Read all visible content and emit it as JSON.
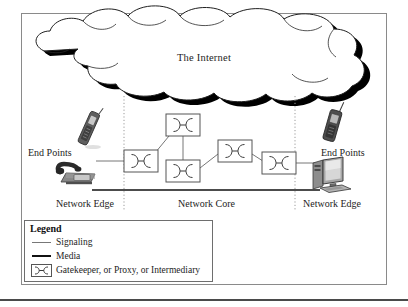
{
  "figure": {
    "cloud_label": "The Internet",
    "endpoint_label_left": "End Points",
    "endpoint_label_right": "End Points",
    "zone_labels": {
      "left": "Network Edge",
      "center": "Network Core",
      "right": "Network Edge"
    }
  },
  "legend": {
    "title": "Legend",
    "items": [
      {
        "symbol": "thin-line",
        "label": "Signaling"
      },
      {
        "symbol": "thick-line",
        "label": "Media"
      },
      {
        "symbol": "gatekeeper-box",
        "label": "Gatekeeper, or Proxy, or Intermediary"
      }
    ]
  },
  "nodes": {
    "gatekeepers": [
      {
        "id": "gk-edge-left",
        "x": 124,
        "y": 150,
        "w": 34,
        "h": 22
      },
      {
        "id": "gk-core-top",
        "x": 166,
        "y": 114,
        "w": 34,
        "h": 22
      },
      {
        "id": "gk-core-bottom",
        "x": 166,
        "y": 160,
        "w": 34,
        "h": 22
      },
      {
        "id": "gk-core-right",
        "x": 218,
        "y": 140,
        "w": 34,
        "h": 22
      },
      {
        "id": "gk-edge-right",
        "x": 262,
        "y": 152,
        "w": 34,
        "h": 22
      }
    ],
    "devices": [
      {
        "id": "mobile-phone-left",
        "type": "mobile-phone",
        "x": 80,
        "y": 115
      },
      {
        "id": "desk-phone-left",
        "type": "desk-phone",
        "x": 63,
        "y": 168
      },
      {
        "id": "mobile-phone-right",
        "type": "mobile-phone",
        "x": 324,
        "y": 110
      },
      {
        "id": "computer-right",
        "type": "desktop-computer",
        "x": 316,
        "y": 165
      }
    ]
  },
  "colors": {
    "signaling_line": "#777777",
    "media_line": "#111111",
    "frame_border": "#8a8a8a",
    "cloud_outline": "#222222",
    "cloud_shadow": "#000000",
    "divider_dotted": "#9a9a9a",
    "text": "#1d1d1d"
  },
  "dividers": {
    "left_x": 124,
    "right_x": 295,
    "top_y": 96,
    "bottom_y": 196
  }
}
